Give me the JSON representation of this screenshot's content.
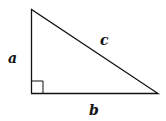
{
  "diagram": {
    "type": "right-triangle",
    "labels": {
      "vertical_leg": "a",
      "horizontal_leg": "b",
      "hypotenuse": "c"
    },
    "right_angle_marker": true,
    "colors": {
      "stroke": "#111111",
      "background": "#ffffff"
    }
  }
}
